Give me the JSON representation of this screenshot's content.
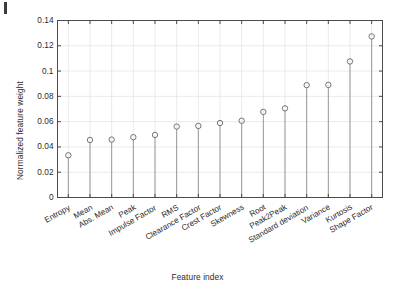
{
  "chart_data": {
    "type": "scatter",
    "title": "",
    "xlabel": "Feature index",
    "ylabel": "Normalized feature weight",
    "categories": [
      "Entropy",
      "Mean",
      "Abs. Mean",
      "Peak",
      "Impulse Factor",
      "RMS",
      "Clearance Factor",
      "Crest Factor",
      "Skewness",
      "Root",
      "Peak2Peak",
      "Standard deviation",
      "Variance",
      "Kurtosis",
      "Shape Factor"
    ],
    "values": [
      0.0334,
      0.0455,
      0.0458,
      0.0477,
      0.0495,
      0.0561,
      0.0566,
      0.0589,
      0.0607,
      0.0677,
      0.0705,
      0.0889,
      0.0891,
      0.1076,
      0.1274
    ],
    "ylim": [
      0,
      0.14
    ],
    "yticks": [
      0,
      0.02,
      0.04,
      0.06,
      0.08,
      0.1,
      0.12,
      0.14
    ],
    "ytick_labels": [
      "0",
      "0.02",
      "0.04",
      "0.06",
      "0.08",
      "0.1",
      "0.12",
      "0.14"
    ],
    "grid": true,
    "legend": "none",
    "marker": "open-circle",
    "stem": true,
    "colors": {
      "marker": "#6e6e6e",
      "stem": "#8a8a8a",
      "axis": "#4a4a4a",
      "grid": "#e4e4e4",
      "text": "#2b2b2b",
      "background": "#ffffff"
    }
  }
}
